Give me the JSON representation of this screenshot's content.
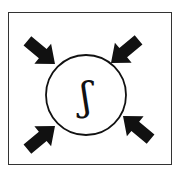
{
  "diagram": {
    "center_symbol": "ʃ",
    "arrows": [
      {
        "name": "top-left",
        "direction": "inward"
      },
      {
        "name": "top-right",
        "direction": "inward"
      },
      {
        "name": "bottom-left",
        "direction": "inward"
      },
      {
        "name": "bottom-right",
        "direction": "inward"
      }
    ],
    "colors": {
      "arrow": "#111111",
      "border": "#333333",
      "background": "#ffffff"
    }
  }
}
